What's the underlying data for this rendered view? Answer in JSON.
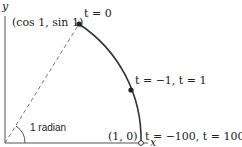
{
  "diagram": {
    "axes": {
      "x_label": "x",
      "y_label": "y"
    },
    "points": [
      {
        "id": "top",
        "coord_label": "(cos 1, sin 1)",
        "param_label": "t = 0",
        "style": "filled"
      },
      {
        "id": "middle",
        "param_label": "t = −1, t = 1",
        "style": "filled"
      },
      {
        "id": "end",
        "coord_label": "(1, 0)",
        "param_label": "t = −100, t = 100",
        "style": "open"
      }
    ],
    "angle_label": "1 radian",
    "colors": {
      "curve": "#333333",
      "axis": "#555555",
      "dashed": "#666666"
    }
  }
}
